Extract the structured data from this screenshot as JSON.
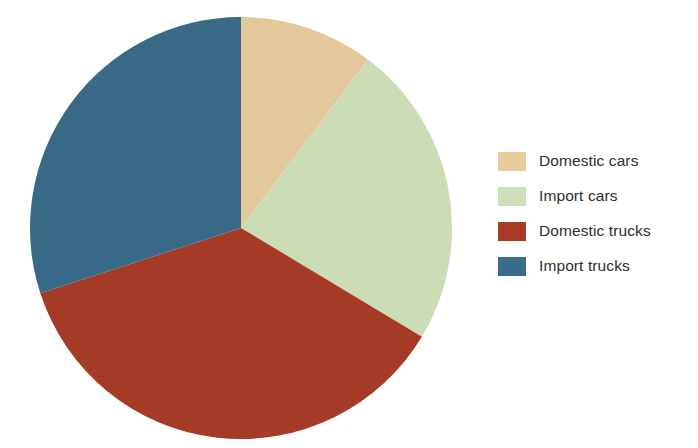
{
  "chart_data": {
    "type": "pie",
    "title": "",
    "categories": [
      "Domestic cars",
      "Import cars",
      "Domestic trucks",
      "Import trucks"
    ],
    "values": [
      10.3,
      23.3,
      36.4,
      30.0
    ],
    "value_unit": "percent",
    "angles_deg": [
      37,
      84,
      131,
      108
    ],
    "start_angle_deg": 0,
    "direction": "clockwise",
    "colors": [
      "#e7cc9c",
      "#cfe0b9",
      "#a83c26",
      "#386c8a"
    ],
    "legend_position": "right",
    "grid": false,
    "slices": [
      {
        "label": "Domestic cars",
        "value": 10.3,
        "color": "#e7cc9c",
        "start_deg": 0,
        "end_deg": 37
      },
      {
        "label": "Import cars",
        "value": 23.3,
        "color": "#cfe0b9",
        "start_deg": 37,
        "end_deg": 121
      },
      {
        "label": "Domestic trucks",
        "value": 36.4,
        "color": "#a83c26",
        "start_deg": 121,
        "end_deg": 252
      },
      {
        "label": "Import trucks",
        "value": 30.0,
        "color": "#386c8a",
        "start_deg": 252,
        "end_deg": 360
      }
    ]
  },
  "legend": {
    "items": [
      {
        "label": "Domestic cars",
        "color": "#e7cc9c"
      },
      {
        "label": "Import cars",
        "color": "#cfe0b9"
      },
      {
        "label": "Domestic trucks",
        "color": "#a83c26"
      },
      {
        "label": "Import trucks",
        "color": "#386c8a"
      }
    ]
  },
  "canvas": {
    "background": "#ffffff",
    "text_color": "#2e2e2e",
    "center_x": 241,
    "center_y": 228,
    "radius": 211
  }
}
